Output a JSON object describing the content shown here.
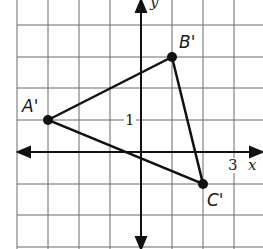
{
  "figure": {
    "type": "coordinate-grid",
    "axes": {
      "x_label": "x",
      "y_label": "y",
      "tick_labels": {
        "x": "3",
        "y": "1"
      }
    },
    "points": [
      {
        "name": "A'",
        "x": -3,
        "y": 1
      },
      {
        "name": "B'",
        "x": 1,
        "y": 3
      },
      {
        "name": "C'",
        "x": 2,
        "y": -1
      }
    ],
    "colors": {
      "grid": "#6a6a6a",
      "line": "#111111"
    }
  }
}
